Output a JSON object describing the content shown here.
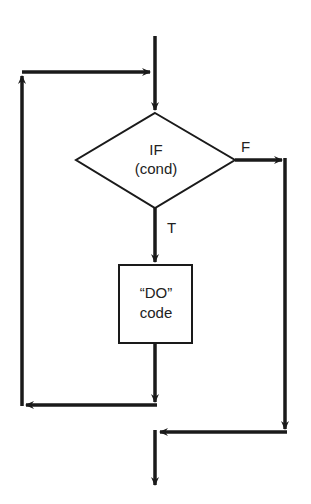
{
  "diagram": {
    "type": "flowchart",
    "title": "",
    "nodes": [
      {
        "id": "decision",
        "shape": "diamond",
        "line1": "IF",
        "line2": "(cond)"
      },
      {
        "id": "process",
        "shape": "rectangle",
        "line1": "“DO”",
        "line2": "code"
      }
    ],
    "edges": [
      {
        "from": "entry",
        "to": "decision",
        "label": ""
      },
      {
        "from": "decision",
        "to": "process",
        "label": "T"
      },
      {
        "from": "decision",
        "to": "exit",
        "label": "F"
      },
      {
        "from": "process",
        "to": "decision",
        "label": "",
        "note": "loop back"
      }
    ],
    "labels": {
      "true_branch": "T",
      "false_branch": "F"
    },
    "colors": {
      "line": "#1a1a1a",
      "background": "#ffffff"
    }
  }
}
